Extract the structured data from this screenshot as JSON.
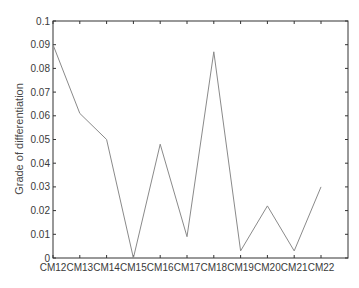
{
  "chart_data": {
    "type": "line",
    "title": "",
    "xlabel": "",
    "ylabel": "Grade of differentiation",
    "categories": [
      "CM12",
      "CM13",
      "CM14",
      "CM15",
      "CM16",
      "CM17",
      "CM18",
      "CM19",
      "CM20",
      "CM21",
      "CM22"
    ],
    "series": [
      {
        "name": "Grade of differentiation",
        "values": [
          0.09,
          0.061,
          0.05,
          0.0,
          0.048,
          0.009,
          0.087,
          0.003,
          0.022,
          0.003,
          0.03
        ]
      }
    ],
    "ylim": [
      0,
      0.1
    ],
    "yticks": [
      0,
      0.01,
      0.02,
      0.03,
      0.04,
      0.05,
      0.06,
      0.07,
      0.08,
      0.09,
      0.1
    ],
    "ytick_labels": [
      "0",
      "0.01",
      "0.02",
      "0.03",
      "0.04",
      "0.05",
      "0.06",
      "0.07",
      "0.08",
      "0.09",
      "0.1"
    ],
    "grid": false,
    "legend": null,
    "line_color": "#8a8a8a",
    "axis_color": "#333333"
  }
}
